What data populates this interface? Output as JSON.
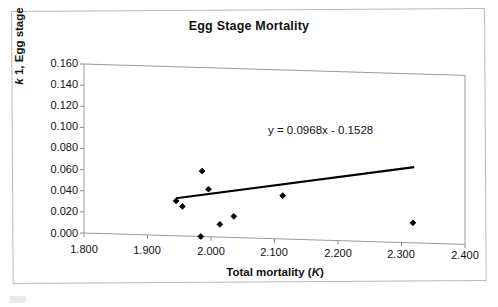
{
  "figure": {
    "title": "Egg Stage Mortality",
    "background": "#ffffff",
    "frame_color": "#b9b9b9",
    "caption_marker": ""
  },
  "axes": {
    "x_title_prefix": "Total mortality (",
    "x_title_italic": "K",
    "x_title_suffix": ")",
    "y_title_italic": "k",
    "y_title_rest": " 1, Egg stage",
    "x_ticks": [
      "1.800",
      "1.900",
      "2.000",
      "2.100",
      "2.200",
      "2.300",
      "2.400"
    ],
    "y_ticks": [
      "0.160",
      "0.140",
      "0.120",
      "0.100",
      "0.080",
      "0.060",
      "0.040",
      "0.020",
      "0.000"
    ]
  },
  "annotation": {
    "equation": "y = 0.0968x - 0.1528"
  },
  "chart_data": {
    "type": "scatter",
    "title": "Egg Stage Mortality",
    "xlabel": "Total mortality (K)",
    "ylabel": "k 1, Egg stage",
    "xlim": [
      1.8,
      2.4
    ],
    "ylim": [
      0.0,
      0.16
    ],
    "xticks": [
      1.8,
      1.9,
      2.0,
      2.1,
      2.2,
      2.3,
      2.4
    ],
    "yticks": [
      0.0,
      0.02,
      0.04,
      0.06,
      0.08,
      0.1,
      0.12,
      0.14,
      0.16
    ],
    "grid": false,
    "legend": false,
    "marker": "filled-diamond",
    "marker_color": "#000000",
    "points": [
      {
        "x": 1.945,
        "y": 0.033
      },
      {
        "x": 1.955,
        "y": 0.028
      },
      {
        "x": 1.984,
        "y": 0.0
      },
      {
        "x": 1.986,
        "y": 0.062
      },
      {
        "x": 1.996,
        "y": 0.045
      },
      {
        "x": 2.014,
        "y": 0.012
      },
      {
        "x": 2.036,
        "y": 0.02
      },
      {
        "x": 2.113,
        "y": 0.041
      },
      {
        "x": 2.318,
        "y": 0.019
      }
    ],
    "trendline": {
      "type": "linear",
      "equation": "y = 0.0968x - 0.1528",
      "slope": 0.0968,
      "intercept": -0.1528,
      "x_start": 1.945,
      "x_end": 2.32,
      "color": "#000000"
    }
  }
}
